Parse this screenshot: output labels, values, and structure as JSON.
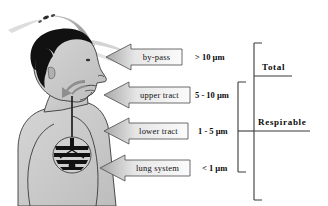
{
  "figure": {
    "background_color": "#ffffff"
  },
  "colors": {
    "hair": "#121212",
    "skin": "#c9c9c9",
    "skin_outline": "#3a3a3a",
    "lung": "#151515",
    "callout_fill_light": "#f2f2f2",
    "callout_fill_dark": "#b4b4b4",
    "callout_outline": "#4a4a4a",
    "bracket": "#3a3a3a",
    "text": "#101010",
    "arrow": "#9a9a9a"
  },
  "person": {
    "name": "human-head-and-torso-profile",
    "description": "side profile of a person showing nose, mouth, throat, trachea and lungs"
  },
  "bypass_arrow": {
    "name": "bypass-particle-path-arrow",
    "description": "curved grey arrow with particles arcing over the head"
  },
  "callouts": [
    {
      "id": "by-pass",
      "label": "by-pass",
      "size": "> 10  µm",
      "arrow_name": "callout-arrow-by-pass"
    },
    {
      "id": "upper-tract",
      "label": "upper tract",
      "size": "5 - 10  µm",
      "arrow_name": "callout-arrow-upper-tract"
    },
    {
      "id": "lower-tract",
      "label": "lower tract",
      "size": "1 - 5  µm",
      "arrow_name": "callout-arrow-lower-tract"
    },
    {
      "id": "lung-system",
      "label": "lung system",
      "size": "< 1  µm",
      "arrow_name": "callout-arrow-lung-system"
    }
  ],
  "brackets": [
    {
      "id": "total",
      "label": "Total",
      "covers": [
        "by-pass",
        "upper tract",
        "lower tract",
        "lung system"
      ]
    },
    {
      "id": "respirable",
      "label": "Respirable",
      "covers": [
        "upper tract",
        "lower tract",
        "lung system"
      ]
    }
  ]
}
